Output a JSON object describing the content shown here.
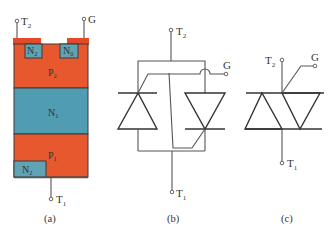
{
  "colors": {
    "p_layer": "#e8582f",
    "n_layer": "#4f9cb3",
    "n_region": "#5fa3b5",
    "electrode": "#e34a2b",
    "line": "#333333"
  },
  "panel_a": {
    "caption": "(a)",
    "terminals": {
      "t2": {
        "main": "T",
        "sub": "2"
      },
      "g": {
        "main": "G"
      },
      "t1": {
        "main": "T",
        "sub": "1"
      }
    },
    "layers": {
      "p2": {
        "main": "P",
        "sub": "2"
      },
      "n1": {
        "main": "N",
        "sub": "1"
      },
      "p1": {
        "main": "P",
        "sub": "1"
      }
    },
    "regions": {
      "n2_top": {
        "main": "N",
        "sub": "2"
      },
      "n0": {
        "main": "N",
        "sub": "0"
      },
      "n2_bottom": {
        "main": "N",
        "sub": "2"
      }
    }
  },
  "panel_b": {
    "caption": "(b)",
    "terminals": {
      "t2": {
        "main": "T",
        "sub": "2"
      },
      "g": {
        "main": "G"
      },
      "t1": {
        "main": "T",
        "sub": "1"
      }
    }
  },
  "panel_c": {
    "caption": "(c)",
    "terminals": {
      "t2": {
        "main": "T",
        "sub": "2"
      },
      "g": {
        "main": "G"
      },
      "t1": {
        "main": "T",
        "sub": "1"
      }
    }
  }
}
